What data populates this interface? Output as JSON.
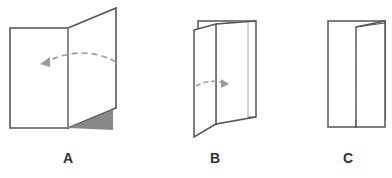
{
  "diagram": {
    "type": "folding-steps",
    "steps": [
      {
        "id": "A",
        "label": "A",
        "description": "Open sheet with right panel folding left",
        "arrow": "dashed curve pointing left",
        "shaded_corner": true
      },
      {
        "id": "B",
        "label": "B",
        "description": "Partially folded sheet, fold opening right",
        "arrow": "dashed curve pointing right"
      },
      {
        "id": "C",
        "label": "C",
        "description": "Folded sheet with dashed fold line",
        "fold_line": "dashed vertical"
      }
    ],
    "colors": {
      "outline": "#555555",
      "crease": "#aaaaaa",
      "arrow": "#999999",
      "shade": "#888888",
      "label": "#333333",
      "background": "#ffffff"
    }
  }
}
